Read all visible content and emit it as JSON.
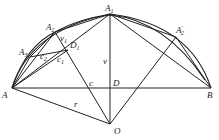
{
  "diagram": {
    "type": "geometry",
    "points": {
      "A": {
        "label": "A",
        "x": 12,
        "y": 88
      },
      "B": {
        "label": "B",
        "x": 211,
        "y": 88
      },
      "A1": {
        "label": "A",
        "sub": "1",
        "x": 110,
        "y": 14
      },
      "A2": {
        "label": "A",
        "sub": "2",
        "x": 55,
        "y": 32
      },
      "A3": {
        "label": "A",
        "sub": "3",
        "x": 30,
        "y": 57
      },
      "A2p": {
        "label": "A",
        "sub": "2",
        "prime": "′",
        "x": 176,
        "y": 37
      },
      "O": {
        "label": "O",
        "x": 110,
        "y": 124
      },
      "D": {
        "label": "D",
        "x": 110,
        "y": 88
      },
      "D1": {
        "label": "D",
        "sub": "1",
        "x": 68,
        "y": 50
      }
    },
    "labels": {
      "A": "A",
      "B": "B",
      "A1": "A",
      "A1_sub": "1",
      "A2": "A",
      "A2_sub": "2",
      "A3": "A",
      "A3_sub": "3",
      "A2p": "A",
      "A2p_sub": "2",
      "A2p_prime": "′",
      "O": "O",
      "D": "D",
      "D1": "D",
      "D1_sub": "1",
      "c": "c",
      "c1": "c",
      "c1_sub": "1",
      "c2": "c",
      "c2_sub": "2",
      "v": "v",
      "v1": "v",
      "v1_sub": "1",
      "r": "r"
    }
  }
}
